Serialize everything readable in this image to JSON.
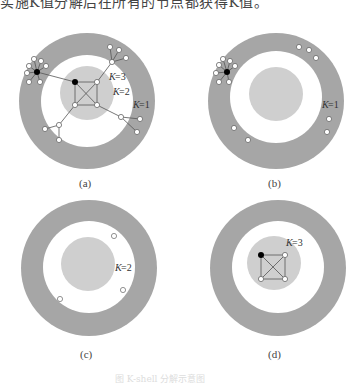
{
  "top_text": "实施K值分解后在所有的节点都获得K值。",
  "panels": [
    {
      "id": "a",
      "caption": "(a)",
      "labels": [
        "Ks=3",
        "Ks=2",
        "Ks=1"
      ]
    },
    {
      "id": "b",
      "caption": "(b)",
      "labels": [
        "Ks=1"
      ]
    },
    {
      "id": "c",
      "caption": "(c)",
      "labels": [
        "Ks=2"
      ]
    },
    {
      "id": "d",
      "caption": "(d)",
      "labels": [
        "Ks=3"
      ]
    }
  ],
  "figure_caption": "图  K-shell 分解示意图",
  "colors": {
    "outer_ring": "#a6a6a6",
    "inner_core": "#cfcfcf",
    "node_fill": "#ffffff",
    "node_stroke": "#666666",
    "hub": "#000000"
  }
}
